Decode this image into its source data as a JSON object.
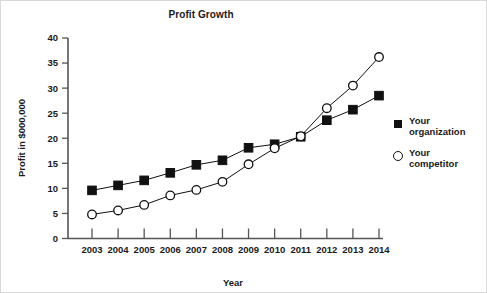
{
  "chart_data": {
    "type": "line",
    "title": "Profit Growth",
    "xlabel": "Year",
    "ylabel": "Profit in $000,000",
    "categories": [
      "2003",
      "2004",
      "2005",
      "2006",
      "2007",
      "2008",
      "2009",
      "2010",
      "2011",
      "2012",
      "2013",
      "2014"
    ],
    "x": [
      2003,
      2004,
      2005,
      2006,
      2007,
      2008,
      2009,
      2010,
      2011,
      2012,
      2013,
      2014
    ],
    "xlim": [
      2003,
      2014
    ],
    "ylim": [
      0,
      40
    ],
    "yticks": [
      0,
      5,
      10,
      15,
      20,
      25,
      30,
      35,
      40
    ],
    "ytick_labels": [
      "0",
      "5",
      "10",
      "15",
      "20",
      "25",
      "30",
      "35",
      "40"
    ],
    "grid": false,
    "legend_position": "right",
    "series": [
      {
        "name": "Your organization",
        "marker": "filled-square",
        "values": [
          9.6,
          10.6,
          11.6,
          13.1,
          14.7,
          15.6,
          18.1,
          18.8,
          20.3,
          23.6,
          25.7,
          28.5
        ]
      },
      {
        "name": "Your competitor",
        "marker": "open-circle",
        "values": [
          4.8,
          5.6,
          6.7,
          8.6,
          9.7,
          11.3,
          14.8,
          18.0,
          20.4,
          26.0,
          30.5,
          36.2
        ]
      }
    ]
  },
  "legend": {
    "items": [
      {
        "label_line1": "Your",
        "label_line2": "organization",
        "marker": "filled-square"
      },
      {
        "label_line1": "Your",
        "label_line2": "competitor",
        "marker": "open-circle"
      }
    ]
  },
  "colors": {
    "series": "#111111",
    "axis": "#555555",
    "text": "#1a1a1a",
    "background": "#ffffff"
  }
}
